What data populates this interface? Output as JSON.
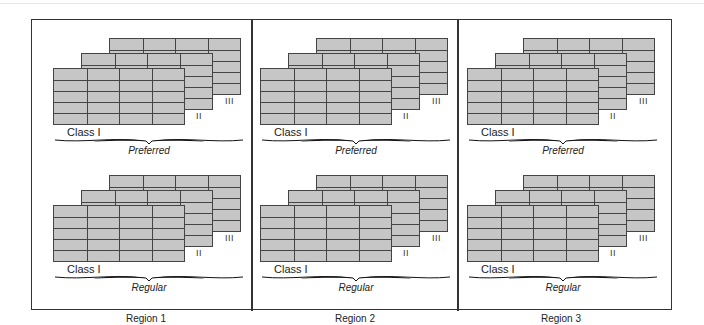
{
  "figure": {
    "regions": [
      {
        "label": "Region 1",
        "x": 53,
        "tiers": [
          {
            "name": "Preferred",
            "class_label": "Class I",
            "sheets": [
              "I",
              "II",
              "III"
            ],
            "roman_II": "II",
            "roman_III": "III"
          },
          {
            "name": "Regular",
            "class_label": "Class I",
            "sheets": [
              "I",
              "II",
              "III"
            ],
            "roman_II": "II",
            "roman_III": "III"
          }
        ]
      },
      {
        "label": "Region 2",
        "x": 260,
        "tiers": [
          {
            "name": "Preferred",
            "class_label": "Class I",
            "sheets": [
              "I",
              "II",
              "III"
            ],
            "roman_II": "II",
            "roman_III": "III"
          },
          {
            "name": "Regular",
            "class_label": "Class I",
            "sheets": [
              "I",
              "II",
              "III"
            ],
            "roman_II": "II",
            "roman_III": "III"
          }
        ]
      },
      {
        "label": "Region 3",
        "x": 467,
        "tiers": [
          {
            "name": "Preferred",
            "class_label": "Class I",
            "sheets": [
              "I",
              "II",
              "III"
            ],
            "roman_II": "II",
            "roman_III": "III"
          },
          {
            "name": "Regular",
            "class_label": "Class I",
            "sheets": [
              "I",
              "II",
              "III"
            ],
            "roman_II": "II",
            "roman_III": "III"
          }
        ]
      }
    ],
    "sheet_grid": {
      "columns": 4,
      "rows": 5
    },
    "colors": {
      "cell_fill": "#c6c6c6",
      "grid_line": "#444444",
      "frame": "#333333",
      "text": "#222222"
    }
  }
}
